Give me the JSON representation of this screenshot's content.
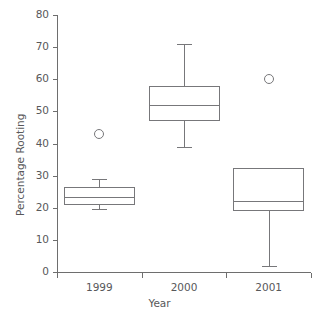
{
  "chart_data": {
    "type": "box",
    "title": "",
    "xlabel": "Year",
    "ylabel": "Percentage Rooting",
    "categories": [
      "1999",
      "2000",
      "2001"
    ],
    "ylim": [
      0,
      80
    ],
    "yticks": [
      0,
      10,
      20,
      30,
      40,
      50,
      60,
      70,
      80
    ],
    "ytick_labels": [
      "0",
      "10",
      "20",
      "30",
      "40",
      "50",
      "60",
      "70",
      "80"
    ],
    "grid": false,
    "legend": "none",
    "boxes": [
      {
        "category": "1999",
        "whisker_low": 19.5,
        "q1": 21,
        "median": 23.5,
        "q3": 26.5,
        "whisker_high": 29,
        "outliers": [
          43
        ]
      },
      {
        "category": "2000",
        "whisker_low": 39,
        "q1": 47,
        "median": 52,
        "q3": 58,
        "whisker_high": 71,
        "outliers": []
      },
      {
        "category": "2001",
        "whisker_low": 2,
        "q1": 19,
        "median": 22,
        "q3": 32.5,
        "whisker_high": 32.5,
        "outliers": [
          60
        ]
      }
    ],
    "colors": {
      "axis": "#6e6e6e",
      "box_stroke": "#77777a",
      "text": "#58585a",
      "background": "#ffffff"
    }
  }
}
